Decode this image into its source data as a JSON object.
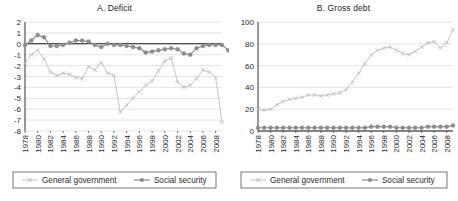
{
  "figure": {
    "background": "#ffffff",
    "panel_count": 2
  },
  "colors": {
    "general_government": "#b6b6b6",
    "social_security": "#8c8c8c",
    "gridline": "#d9d9d9",
    "axis": "#1a1a1a",
    "text": "#222222",
    "legend_border": "#555555"
  },
  "legend": {
    "items": [
      {
        "label": "General government",
        "marker": "x-marker",
        "color": "#b6b6b6"
      },
      {
        "label": "Social security",
        "marker": "circle-marker",
        "color": "#8c8c8c"
      }
    ]
  },
  "chart_data": [
    {
      "type": "line",
      "panel": "A",
      "title": "A. Deficit",
      "xlabel": "",
      "ylabel": "",
      "ylim": [
        -8,
        2
      ],
      "yticks": [
        2,
        1,
        0,
        -1,
        -2,
        -3,
        -4,
        -5,
        -6,
        -7,
        -8
      ],
      "ytick_labels": [
        "2",
        "1",
        "0",
        "-1",
        "-2",
        "-3",
        "-4",
        "-5",
        "-6",
        "-7",
        "-8"
      ],
      "grid": true,
      "legend_position": "bottom",
      "x": [
        1978,
        1979,
        1980,
        1981,
        1982,
        1983,
        1984,
        1985,
        1986,
        1987,
        1988,
        1989,
        1990,
        1991,
        1992,
        1993,
        1994,
        1995,
        1996,
        1997,
        1998,
        1999,
        2000,
        2001,
        2002,
        2003,
        2004,
        2005,
        2006,
        2007,
        2008,
        2009
      ],
      "xtick_labels": [
        "1978",
        "1980",
        "1982",
        "1984",
        "1986",
        "1988",
        "1990",
        "1992",
        "1994",
        "1996",
        "1998",
        "2000",
        "2002",
        "2004",
        "2006",
        "2008"
      ],
      "series": [
        {
          "name": "General government",
          "color": "#b6b6b6",
          "marker": "x-marker",
          "values": [
            -1.8,
            -1.0,
            -0.6,
            -1.4,
            -2.6,
            -2.9,
            -2.7,
            -2.8,
            -3.1,
            -3.2,
            -2.1,
            -2.4,
            -1.7,
            -2.7,
            -2.9,
            -6.3,
            -5.6,
            -5.0,
            -4.4,
            -3.8,
            -3.4,
            -2.5,
            -1.6,
            -1.3,
            -3.5,
            -4.0,
            -3.8,
            -3.2,
            -2.4,
            -2.6,
            -3.1,
            -7.2
          ]
        },
        {
          "name": "Social security",
          "color": "#8c8c8c",
          "marker": "circle-marker",
          "values": [
            -0.1,
            0.3,
            0.8,
            0.6,
            -0.2,
            -0.2,
            -0.1,
            0.1,
            0.3,
            0.3,
            0.2,
            -0.1,
            -0.3,
            0.0,
            -0.1,
            -0.1,
            -0.2,
            -0.3,
            -0.4,
            -0.8,
            -0.7,
            -0.6,
            -0.5,
            -0.4,
            -0.5,
            -0.9,
            -1.0,
            -0.4,
            -0.2,
            -0.1,
            -0.1,
            -0.1,
            -0.6,
            -1.2
          ]
        }
      ]
    },
    {
      "type": "line",
      "panel": "B",
      "title": "B. Gross debt",
      "xlabel": "",
      "ylabel": "",
      "ylim": [
        0,
        100
      ],
      "yticks": [
        0,
        20,
        40,
        60,
        80,
        100
      ],
      "ytick_labels": [
        "0",
        "20",
        "40",
        "60",
        "80",
        "100"
      ],
      "grid": true,
      "legend_position": "bottom",
      "x": [
        1978,
        1979,
        1980,
        1981,
        1982,
        1983,
        1984,
        1985,
        1986,
        1987,
        1988,
        1989,
        1990,
        1991,
        1992,
        1993,
        1994,
        1995,
        1996,
        1997,
        1998,
        1999,
        2000,
        2001,
        2002,
        2003,
        2004,
        2005,
        2006,
        2007,
        2008,
        2009
      ],
      "xtick_labels": [
        "1978",
        "1980",
        "1982",
        "1984",
        "1986",
        "1988",
        "1990",
        "1992",
        "1994",
        "1996",
        "1998",
        "2000",
        "2002",
        "2004",
        "2006",
        "2008"
      ],
      "series": [
        {
          "name": "General government",
          "color": "#b6b6b6",
          "marker": "x-marker",
          "values": [
            20,
            19,
            20,
            24,
            27,
            29,
            30,
            31,
            33,
            33,
            32,
            33,
            34,
            35,
            38,
            45,
            53,
            62,
            70,
            74,
            76,
            77,
            74,
            71,
            70,
            73,
            77,
            81,
            82,
            76,
            81,
            93
          ]
        },
        {
          "name": "Social security",
          "color": "#8c8c8c",
          "marker": "circle-marker",
          "values": [
            3,
            3,
            3,
            3,
            3,
            3,
            3,
            3,
            3,
            3,
            3,
            3,
            3,
            3,
            3,
            3,
            3,
            3,
            4,
            4,
            4,
            4,
            3,
            3,
            3,
            3,
            3,
            4,
            4,
            4,
            4,
            5
          ]
        }
      ]
    }
  ]
}
